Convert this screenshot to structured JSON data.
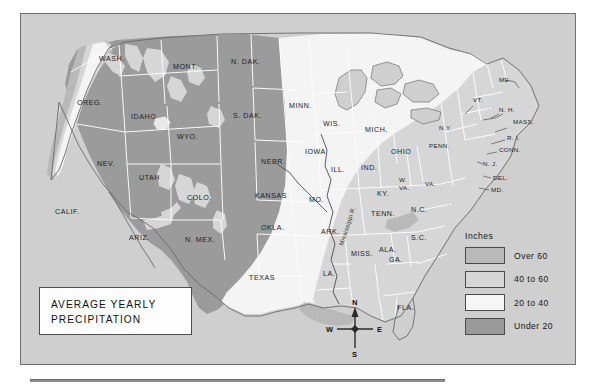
{
  "title": {
    "line1": "AVERAGE YEARLY",
    "line2": "PRECIPITATION"
  },
  "legend": {
    "heading": "Inches",
    "items": [
      {
        "label": "Over 60",
        "color": "#b9b9b9"
      },
      {
        "label": "40 to 60",
        "color": "#d6d6d6"
      },
      {
        "label": "20 to 40",
        "color": "#f4f4f4"
      },
      {
        "label": "Under 20",
        "color": "#9b9b9b"
      }
    ]
  },
  "compass": {
    "north": "N",
    "east": "E",
    "south": "S",
    "west": "W"
  },
  "map": {
    "background_color": "#cfcfcf",
    "border_color": "#6f6f6f",
    "river_labels": [
      {
        "name": "Mississippi R."
      }
    ],
    "states": [
      {
        "abbr": "WASH.",
        "name": "Washington",
        "band": "Under 20"
      },
      {
        "abbr": "OREG.",
        "name": "Oregon",
        "band": "Under 20"
      },
      {
        "abbr": "IDAHO",
        "name": "Idaho",
        "band": "Under 20"
      },
      {
        "abbr": "MONT.",
        "name": "Montana",
        "band": "Under 20"
      },
      {
        "abbr": "N. DAK.",
        "name": "North Dakota",
        "band": "Under 20"
      },
      {
        "abbr": "S. DAK.",
        "name": "South Dakota",
        "band": "Under 20"
      },
      {
        "abbr": "WYO.",
        "name": "Wyoming",
        "band": "Under 20"
      },
      {
        "abbr": "NEV.",
        "name": "Nevada",
        "band": "Under 20"
      },
      {
        "abbr": "UTAH",
        "name": "Utah",
        "band": "Under 20"
      },
      {
        "abbr": "COLO.",
        "name": "Colorado",
        "band": "Under 20"
      },
      {
        "abbr": "CALIF.",
        "name": "California",
        "band": "Under 20"
      },
      {
        "abbr": "ARIZ.",
        "name": "Arizona",
        "band": "Under 20"
      },
      {
        "abbr": "N. MEX.",
        "name": "New Mexico",
        "band": "Under 20"
      },
      {
        "abbr": "NEBR.",
        "name": "Nebraska",
        "band": "20 to 40"
      },
      {
        "abbr": "KANSAS",
        "name": "Kansas",
        "band": "20 to 40"
      },
      {
        "abbr": "OKLA.",
        "name": "Oklahoma",
        "band": "20 to 40"
      },
      {
        "abbr": "TEXAS",
        "name": "Texas",
        "band": "20 to 40"
      },
      {
        "abbr": "MINN.",
        "name": "Minnesota",
        "band": "20 to 40"
      },
      {
        "abbr": "IOWA",
        "name": "Iowa",
        "band": "20 to 40"
      },
      {
        "abbr": "MO.",
        "name": "Missouri",
        "band": "20 to 40"
      },
      {
        "abbr": "ARK.",
        "name": "Arkansas",
        "band": "40 to 60"
      },
      {
        "abbr": "LA.",
        "name": "Louisiana",
        "band": "40 to 60"
      },
      {
        "abbr": "MISS.",
        "name": "Mississippi",
        "band": "40 to 60"
      },
      {
        "abbr": "ALA.",
        "name": "Alabama",
        "band": "40 to 60"
      },
      {
        "abbr": "WIS.",
        "name": "Wisconsin",
        "band": "20 to 40"
      },
      {
        "abbr": "ILL.",
        "name": "Illinois",
        "band": "20 to 40"
      },
      {
        "abbr": "MICH.",
        "name": "Michigan",
        "band": "20 to 40"
      },
      {
        "abbr": "IND.",
        "name": "Indiana",
        "band": "20 to 40"
      },
      {
        "abbr": "OHIO",
        "name": "Ohio",
        "band": "20 to 40"
      },
      {
        "abbr": "KY.",
        "name": "Kentucky",
        "band": "40 to 60"
      },
      {
        "abbr": "TENN.",
        "name": "Tennessee",
        "band": "40 to 60"
      },
      {
        "abbr": "W. VA.",
        "name": "West Virginia",
        "band": "40 to 60"
      },
      {
        "abbr": "VA.",
        "name": "Virginia",
        "band": "40 to 60"
      },
      {
        "abbr": "N.C.",
        "name": "North Carolina",
        "band": "40 to 60"
      },
      {
        "abbr": "S.C.",
        "name": "South Carolina",
        "band": "40 to 60"
      },
      {
        "abbr": "GA.",
        "name": "Georgia",
        "band": "40 to 60"
      },
      {
        "abbr": "FLA.",
        "name": "Florida",
        "band": "40 to 60"
      },
      {
        "abbr": "PENN.",
        "name": "Pennsylvania",
        "band": "40 to 60"
      },
      {
        "abbr": "N.Y.",
        "name": "New York",
        "band": "40 to 60"
      },
      {
        "abbr": "ME",
        "name": "Maine",
        "band": "40 to 60"
      },
      {
        "abbr": "VT.",
        "name": "Vermont",
        "band": "40 to 60"
      },
      {
        "abbr": "N. H.",
        "name": "New Hampshire",
        "band": "40 to 60"
      },
      {
        "abbr": "MASS.",
        "name": "Massachusetts",
        "band": "40 to 60"
      },
      {
        "abbr": "R. I.",
        "name": "Rhode Island",
        "band": "40 to 60"
      },
      {
        "abbr": "CONN.",
        "name": "Connecticut",
        "band": "40 to 60"
      },
      {
        "abbr": "N. J.",
        "name": "New Jersey",
        "band": "40 to 60"
      },
      {
        "abbr": "DEL.",
        "name": "Delaware",
        "band": "40 to 60"
      },
      {
        "abbr": "MD.",
        "name": "Maryland",
        "band": "40 to 60"
      }
    ]
  }
}
